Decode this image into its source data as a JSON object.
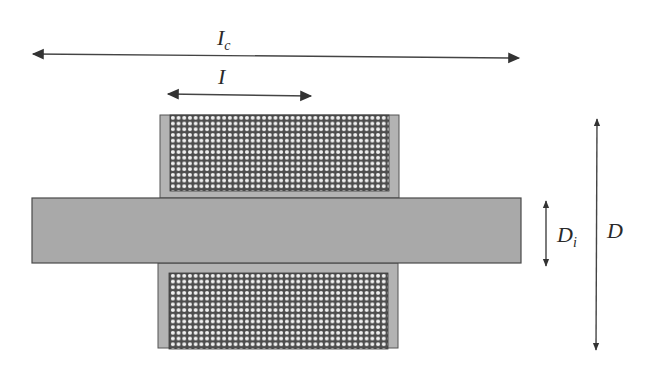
{
  "diagram": {
    "title": "",
    "colors": {
      "background": "#ffffff",
      "core_fill": "#a9a9a9",
      "core_stroke": "#4a4a4a",
      "bobbin_fill": "#b3b3b3",
      "winding_bg": "#4d4d4d",
      "wire_fill": "#f2f2f2",
      "arrow_color": "#333333"
    },
    "labels": {
      "core_length": {
        "main": "I",
        "sub": "c"
      },
      "coil_length": {
        "main": "I",
        "sub": ""
      },
      "inner_diameter": {
        "main": "D",
        "sub": "i"
      },
      "outer_diameter": {
        "main": "D",
        "sub": ""
      }
    },
    "components": [
      {
        "id": "core",
        "name": "Core rod"
      },
      {
        "id": "coil-top",
        "name": "Upper winding section"
      },
      {
        "id": "coil-bottom",
        "name": "Lower winding section"
      }
    ],
    "dimensions": [
      {
        "id": "Ic",
        "orientation": "horizontal",
        "meaning": "core length"
      },
      {
        "id": "I",
        "orientation": "horizontal",
        "meaning": "coil length"
      },
      {
        "id": "Di",
        "orientation": "vertical",
        "meaning": "inner diameter"
      },
      {
        "id": "D",
        "orientation": "vertical",
        "meaning": "outer diameter"
      }
    ]
  }
}
